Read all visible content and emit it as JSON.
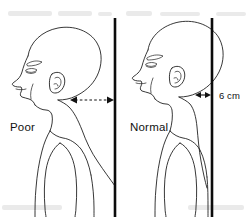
{
  "diagram": {
    "type": "line-art anatomical profile illustration",
    "background_color": "#ffffff",
    "ink_color": "#111111",
    "width": 251,
    "height": 217
  },
  "figures": [
    {
      "id": "poor",
      "caption": "Poor",
      "caption_x": 10,
      "caption_y": 127,
      "description": "Left profile of a head and upper torso with the head carried forward of the vertical plumb line, showing rounded shoulders and forward head posture.",
      "plumb_line_x": 115
    },
    {
      "id": "normal",
      "caption": "Normal",
      "caption_x": 130,
      "caption_y": 127,
      "description": "Right profile of a head and upper torso aligned close to the vertical plumb line, showing neutral head and neck alignment.",
      "plumb_line_x": 212
    }
  ],
  "measurements": [
    {
      "id": "poor-gap",
      "label": "",
      "style": "dashed double-headed arrow",
      "from_x": 71,
      "to_x": 114,
      "y": 100,
      "note": "Horizontal gap between the back of the neck and the plumb line for the poor posture figure"
    },
    {
      "id": "normal-gap",
      "label": "6 cm",
      "label_x": 219,
      "label_y": 99,
      "style": "solid double-headed arrow",
      "from_x": 196,
      "to_x": 211,
      "y": 95,
      "note": "Horizontal gap between the back of the neck and the plumb line for the normal posture figure"
    }
  ],
  "plumb_lines": [
    {
      "id": "plumb-line-left",
      "x": 115,
      "y_top": 18,
      "y_bottom": 217
    },
    {
      "id": "plumb-line-right",
      "x": 212,
      "y_top": 18,
      "y_bottom": 217
    }
  ]
}
